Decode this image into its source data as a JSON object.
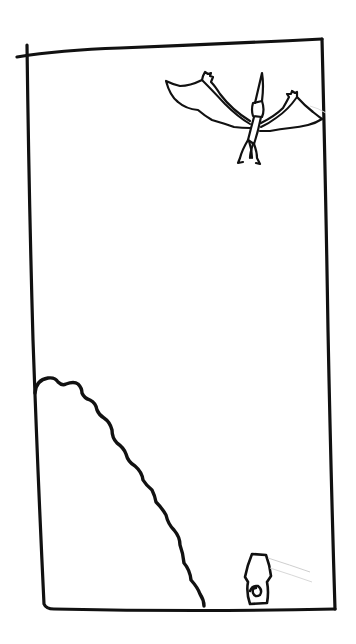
{
  "scene": {
    "description": "Hand-drawn storyboard panel",
    "elements": [
      {
        "name": "frame-border",
        "label": "Panel frame"
      },
      {
        "name": "pterodactyl",
        "label": "Flying pterodactyl, top right"
      },
      {
        "name": "hill",
        "label": "Scalloped hill / cliff, bottom left"
      },
      {
        "name": "lantern-object",
        "label": "Small hexagonal object with spiral, bottom"
      }
    ]
  },
  "colors": {
    "ink": "#111111",
    "paper": "#ffffff"
  }
}
